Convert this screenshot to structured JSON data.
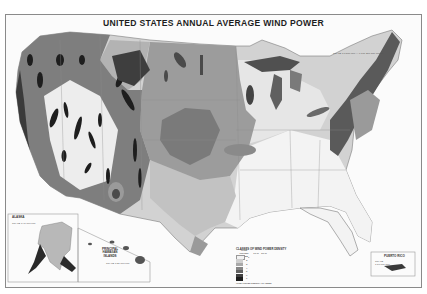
{
  "map": {
    "title": "UNITED STATES ANNUAL AVERAGE WIND POWER",
    "scale_note": "SCALE 1:7,500,000 — 0 100 200 300 MILES",
    "insets": {
      "alaska": {
        "label": "ALASKA",
        "scale_note": "SCALE 1:40,000,000"
      },
      "hawaii": {
        "label": "PRINCIPAL HAWAIIAN ISLANDS",
        "scale_note": "SCALE 1:20,000,000"
      },
      "puerto_rico": {
        "label": "PUERTO RICO",
        "scale_note": "SCALE 1:10,000,000"
      }
    },
    "legend": {
      "title": "CLASSES OF WIND POWER DENSITY",
      "columns": [
        "WIND POWER CLASS",
        "10 m",
        "50 m"
      ],
      "classes": [
        {
          "class": "1",
          "color": "#f2f2f2"
        },
        {
          "class": "2",
          "color": "#cfcfcf"
        },
        {
          "class": "3",
          "color": "#a9a9a9"
        },
        {
          "class": "4",
          "color": "#868686"
        },
        {
          "class": "5",
          "color": "#636363"
        },
        {
          "class": "6",
          "color": "#404040"
        },
        {
          "class": "7",
          "color": "#1c1c1c"
        }
      ],
      "footnote": "WIND POWER DENSITY CLASSES"
    },
    "colors": {
      "class1": "#f4f4f4",
      "class2": "#cdcdcd",
      "class3": "#a8a8a8",
      "class4": "#888888",
      "class5": "#666666",
      "class6": "#454545",
      "class7": "#202020",
      "border": "#7a7a7a"
    }
  }
}
